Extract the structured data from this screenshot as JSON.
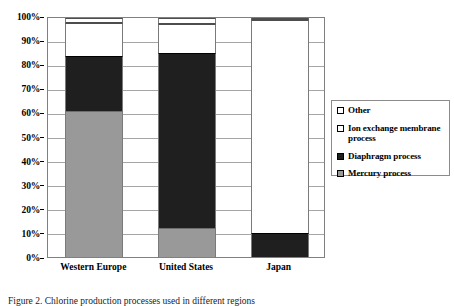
{
  "chart_data": {
    "type": "bar",
    "subtype": "stacked-100-percent",
    "title": "",
    "xlabel": "",
    "ylabel": "",
    "ylim": [
      0,
      100
    ],
    "grid": true,
    "legend_position": "right",
    "categories": [
      "Western Europe",
      "United States",
      "Japan"
    ],
    "ytick_labels": [
      "0%",
      "10%",
      "20%",
      "30%",
      "40%",
      "50%",
      "60%",
      "70%",
      "80%",
      "90%",
      "100%"
    ],
    "ytick_values": [
      0,
      10,
      20,
      30,
      40,
      50,
      60,
      70,
      80,
      90,
      100
    ],
    "series": [
      {
        "name": "Mercury process",
        "color": "#999999",
        "swatch": "sw-gray",
        "values": [
          61,
          12,
          0
        ]
      },
      {
        "name": "Diaphragm process",
        "color": "#1f1f1f",
        "swatch": "sw-black",
        "values": [
          23,
          73.5,
          10
        ]
      },
      {
        "name": "Ion exchange membrane process",
        "color": "#ffffff",
        "swatch": "sw-white",
        "values": [
          14,
          12,
          89
        ]
      },
      {
        "name": "Other",
        "color": "#ffffff",
        "swatch": "sw-white",
        "values": [
          2,
          2.5,
          1
        ]
      }
    ]
  },
  "legend": {
    "items": [
      {
        "label": "Other",
        "swatch": "sw-white"
      },
      {
        "label": "Ion exchange membrane process",
        "swatch": "sw-white"
      },
      {
        "label": "Diaphragm process",
        "swatch": "sw-black"
      },
      {
        "label": "Mercury process",
        "swatch": "sw-gray"
      }
    ]
  },
  "caption": {
    "text": "Figure 2. Chlorine production processes used in different regions"
  }
}
